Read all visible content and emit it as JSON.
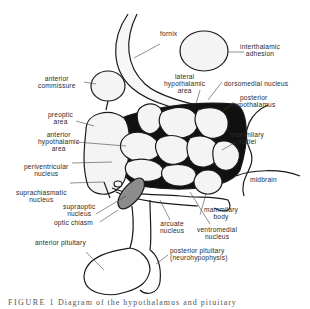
{
  "figure": {
    "type": "anatomical-diagram",
    "subject": "hypothalamus and pituitary",
    "caption_prefix": "FIGURE 1",
    "caption_text": "Diagram of the hypothalamus and pituitary",
    "labels": {
      "fornix": "fornix",
      "interthalamic_adhesion": [
        "interthalamic",
        "adhesion"
      ],
      "anterior_commissure": [
        "anterior",
        "commissure"
      ],
      "lateral_hypothalamic_area": [
        "lateral",
        "hypothalamic",
        "area"
      ],
      "dorsomedial_nucleus": "dorsomedial nucleus",
      "posterior_hypothalamus": [
        "posterior",
        "hypothalamus"
      ],
      "preoptic_area": [
        "preoptic",
        "area"
      ],
      "anterior_hypothalamic_area": [
        "anterior",
        "hypothalamic",
        "area"
      ],
      "mammilary_nuclei": [
        "mammilary",
        "nuclei"
      ],
      "periventricular_nucleus": [
        "periventricular",
        "nucleus"
      ],
      "midbrain": "midbrain",
      "suprachiasmatic_nucleus": [
        "suprachiasmatic",
        "nucleus"
      ],
      "supraoptic_nucleus": [
        "supraoptic",
        "nucleus"
      ],
      "mammilary_body": [
        "mammilary",
        "body"
      ],
      "optic_chiasm": "optic chiasm",
      "arcuate_nucleus": [
        "arcuate",
        "nucleus"
      ],
      "ventromedial_nucleus": [
        "ventromedial",
        "nucleus"
      ],
      "anterior_pituitary": "anterior pituitary",
      "posterior_pituitary": [
        "posterior pituitary",
        "(neurohypophysis)"
      ]
    },
    "colors": {
      "outline": "#1a1a1a",
      "fill": "#f4f4f4",
      "shadow": "#111111",
      "supraoptic_fill": "#8c8c8c",
      "text": "#2a2a2a"
    }
  }
}
